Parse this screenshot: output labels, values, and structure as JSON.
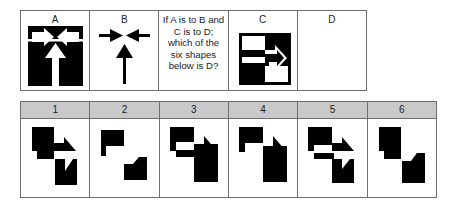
{
  "puzzle": {
    "top_row": {
      "cells": [
        {
          "label": "A",
          "figure": "black-block-with-converging-white-arrows"
        },
        {
          "label": "B",
          "figure": "black-converging-arrows"
        },
        {
          "question": "If A is to B and C is to D; which of the six shapes below is D?"
        },
        {
          "label": "C",
          "figure": "black-square-with-right-arrow-inverted-halves"
        },
        {
          "label": "D",
          "figure": "empty"
        }
      ]
    },
    "answers": {
      "header_color": "#c9c9c9",
      "options": [
        {
          "number": "1",
          "figure": "two-black-blocks-with-right-arrow"
        },
        {
          "number": "2",
          "figure": "two-separated-black-blocks"
        },
        {
          "number": "3",
          "figure": "black-blocks-with-white-band"
        },
        {
          "number": "4",
          "figure": "two-black-blocks-connected"
        },
        {
          "number": "5",
          "figure": "blocks-with-white-right-arrow"
        },
        {
          "number": "6",
          "figure": "two-solid-black-blocks-stepped"
        }
      ]
    }
  }
}
